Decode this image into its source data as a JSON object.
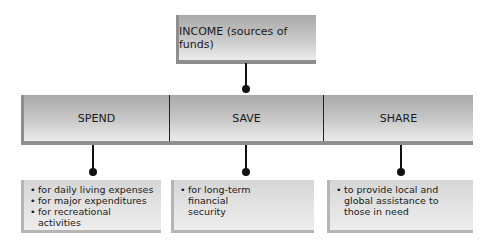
{
  "diagram": {
    "top_node": {
      "label": "INCOME (sources of funds)"
    },
    "categories": [
      {
        "label": "SPEND",
        "items": [
          "for daily living expenses",
          "for major expenditures",
          "for recreational activities"
        ]
      },
      {
        "label": "SAVE",
        "items": [
          "for long-term financial security"
        ]
      },
      {
        "label": "SHARE",
        "items": [
          "to provide local and global assistance to those in need"
        ]
      }
    ],
    "colors": {
      "box_gradient_top": "#a9a9a9",
      "box_gradient_bottom": "#ececec",
      "connector": "#111111"
    }
  }
}
